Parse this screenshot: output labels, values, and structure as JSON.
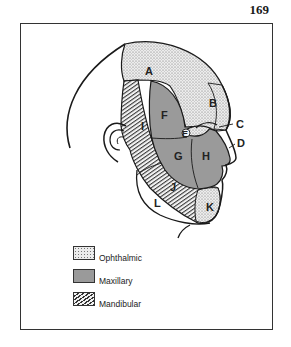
{
  "page": {
    "number": "169"
  },
  "diagram": {
    "colors": {
      "ophthalmic": "#e6e6e6",
      "maxillary": "#9a9a9a",
      "mandibular": "#f0f0f0",
      "outline": "#1a1a1a"
    },
    "region_labels": [
      {
        "id": "A",
        "label": "A",
        "x": 145,
        "y": 75
      },
      {
        "id": "B",
        "label": "B",
        "x": 209,
        "y": 107
      },
      {
        "id": "C",
        "label": "C",
        "x": 236,
        "y": 128
      },
      {
        "id": "D",
        "label": "D",
        "x": 237,
        "y": 147
      },
      {
        "id": "E",
        "label": "E",
        "x": 184,
        "y": 134
      },
      {
        "id": "F",
        "label": "F",
        "x": 161,
        "y": 119
      },
      {
        "id": "G",
        "label": "G",
        "x": 174,
        "y": 160
      },
      {
        "id": "H",
        "label": "H",
        "x": 202,
        "y": 160
      },
      {
        "id": "I",
        "label": "I",
        "x": 141,
        "y": 130
      },
      {
        "id": "J",
        "label": "J",
        "x": 170,
        "y": 191
      },
      {
        "id": "K",
        "label": "K",
        "x": 206,
        "y": 207
      },
      {
        "id": "L",
        "label": "L",
        "x": 154,
        "y": 205
      }
    ]
  },
  "legend": {
    "items": [
      {
        "key": "ophthalmic",
        "label": "Ophthalmic"
      },
      {
        "key": "maxillary",
        "label": "Maxillary"
      },
      {
        "key": "mandibular",
        "label": "Mandibular"
      }
    ]
  }
}
